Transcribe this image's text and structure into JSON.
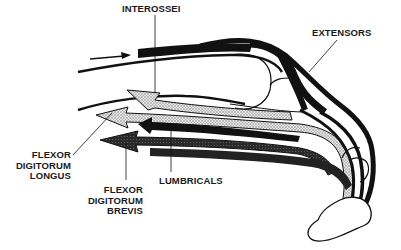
{
  "diagram": {
    "labels": {
      "interossei": "INTEROSSEI",
      "extensors": "EXTENSORS",
      "fdl": [
        "FLEXOR",
        "DIGITORUM",
        "LONGUS"
      ],
      "fdb": [
        "FLEXOR",
        "DIGITORUM",
        "BREVIS"
      ],
      "lumbricals": "LUMBRICALS"
    },
    "colors": {
      "ink": "#111111",
      "stipple_light": "#c8c8c8",
      "stipple_dark": "#3a3a3a",
      "background": "#ffffff"
    }
  }
}
